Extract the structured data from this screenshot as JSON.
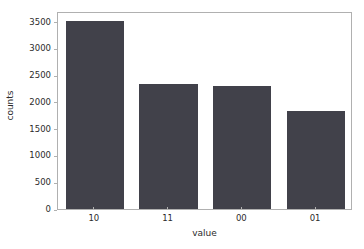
{
  "chart_data": {
    "type": "bar",
    "title": "",
    "xlabel": "value",
    "ylabel": "counts",
    "categories": [
      "10",
      "11",
      "00",
      "01"
    ],
    "values": [
      3520,
      2330,
      2300,
      1830
    ],
    "ylim": [
      0,
      3700
    ],
    "yticks": [
      0,
      500,
      1000,
      1500,
      2000,
      2500,
      3000,
      3500
    ],
    "ytick_labels": [
      "0",
      "500",
      "1000",
      "1500",
      "2000",
      "2500",
      "3000",
      "3500"
    ],
    "xtick_labels": [
      "10",
      "11",
      "00",
      "01"
    ],
    "grid": false,
    "legend": null,
    "bar_color": "#41414a",
    "axes_edge_color": "#b0b0b0",
    "background_color": "#ffffff",
    "text_color": "#2b2b2b"
  }
}
